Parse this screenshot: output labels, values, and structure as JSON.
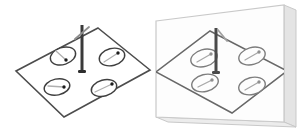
{
  "scene": {
    "background": "#ffffff",
    "colors": {
      "plate_outline": "#4d4d4d",
      "compass_outline": "#3f3f3f",
      "compass_fill": "#ffffff",
      "needle_tail": "#b0b0b0",
      "needle_tip": "#1c1c1c",
      "pole": "#3a3a3a",
      "pole_base": "#2e2e2e",
      "flag": "#8f8f8f",
      "mirror_face_fill": "#fdfdfd",
      "mirror_face_stroke": "#c9c9c9",
      "mirror_side_fill": "#e4e4e4",
      "mirror_side_stroke": "#c9c9c9",
      "mirror_bottom_fill": "#ececec",
      "reflection_outline": "#686868",
      "reflection_compass_outline": "#7d7d7d",
      "reflection_needle": "#a8a8a8",
      "reflection_needle_tip": "#8f8f8f",
      "reflection_pole": "#4a4a4a",
      "reflection_flag": "#a0a0a0"
    },
    "object_plate": {
      "outline": [
        [
          98,
          28
        ],
        [
          150,
          70
        ],
        [
          64,
          117
        ],
        [
          16,
          71
        ]
      ],
      "pole": {
        "x": 82,
        "top": 25,
        "base": 71,
        "base_w": 8,
        "base_h": 3
      },
      "flag": {
        "x1": 75,
        "y1": 39,
        "x2": 89,
        "y2": 27
      },
      "compasses": [
        {
          "cx": 63,
          "cy": 56,
          "rx": 13,
          "ry": 8.5,
          "rot": -18,
          "tail": [
            56,
            51
          ],
          "tip": [
            66,
            60
          ]
        },
        {
          "cx": 112,
          "cy": 57,
          "rx": 13,
          "ry": 8.5,
          "rot": -15,
          "tail": [
            104,
            62
          ],
          "tip": [
            118,
            53
          ]
        },
        {
          "cx": 57,
          "cy": 87,
          "rx": 13,
          "ry": 8,
          "rot": -12,
          "tail": [
            48,
            86
          ],
          "tip": [
            64,
            87
          ]
        },
        {
          "cx": 104,
          "cy": 88,
          "rx": 13,
          "ry": 8,
          "rot": -15,
          "tail": [
            95,
            92
          ],
          "tip": [
            112,
            84
          ]
        }
      ]
    },
    "mirror": {
      "face": [
        [
          156,
          21
        ],
        [
          284,
          5
        ],
        [
          284,
          122
        ],
        [
          156,
          117
        ]
      ],
      "side": [
        [
          284,
          5
        ],
        [
          296,
          10
        ],
        [
          296,
          127
        ],
        [
          284,
          122
        ]
      ],
      "bottom": [
        [
          156,
          117
        ],
        [
          284,
          122
        ],
        [
          296,
          127
        ],
        [
          168,
          122
        ]
      ]
    },
    "reflection": {
      "outline": [
        [
          210,
          31
        ],
        [
          287,
          71
        ],
        [
          232,
          113
        ],
        [
          156,
          72
        ]
      ],
      "pole": {
        "x": 216,
        "top": 28,
        "base": 72,
        "base_w": 8,
        "base_h": 3
      },
      "flag": {
        "x1": 218,
        "y1": 30,
        "x2": 227,
        "y2": 41
      },
      "compasses": [
        {
          "cx": 204,
          "cy": 58,
          "rx": 13.5,
          "ry": 8.5,
          "rot": -16,
          "tail": [
            197,
            62
          ],
          "tip": [
            211,
            54
          ]
        },
        {
          "cx": 252,
          "cy": 56,
          "rx": 13.5,
          "ry": 8.5,
          "rot": -16,
          "tail": [
            245,
            60
          ],
          "tip": [
            259,
            52
          ]
        },
        {
          "cx": 205,
          "cy": 83,
          "rx": 13.5,
          "ry": 8.5,
          "rot": -14,
          "tail": [
            198,
            87
          ],
          "tip": [
            212,
            80
          ]
        },
        {
          "cx": 252,
          "cy": 86,
          "rx": 13.5,
          "ry": 8.5,
          "rot": -14,
          "tail": [
            245,
            90
          ],
          "tip": [
            259,
            82
          ]
        }
      ]
    }
  }
}
